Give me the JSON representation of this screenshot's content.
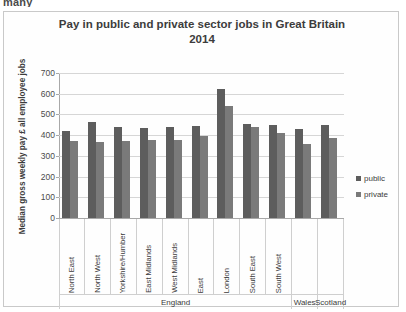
{
  "page": {
    "top_cut_text": "many"
  },
  "chart_data": {
    "type": "bar",
    "title": "Pay in public and private sector jobs in Great Britain",
    "title_line2": "2014",
    "xlabel": "",
    "ylabel": "Median gross weekly pay £ all employee jobs",
    "ylim": [
      0,
      700
    ],
    "yticks": [
      0,
      100,
      200,
      300,
      400,
      500,
      600,
      700
    ],
    "grid": true,
    "legend_position": "right",
    "categories": [
      "North East",
      "North West",
      "Yorkshire/Humber",
      "East Midlands",
      "West Midlands",
      "East",
      "London",
      "South East",
      "South West",
      "",
      ""
    ],
    "groups": [
      {
        "label": "England",
        "span": 9
      },
      {
        "label": "Wales",
        "span": 1
      },
      {
        "label": "Scotland",
        "span": 1
      }
    ],
    "series": [
      {
        "name": "public",
        "color": "#5d5d5d",
        "values": [
          420,
          465,
          440,
          435,
          440,
          445,
          625,
          455,
          450,
          430,
          450
        ]
      },
      {
        "name": "private",
        "color": "#7a7a7a",
        "values": [
          370,
          365,
          370,
          375,
          375,
          395,
          540,
          440,
          410,
          355,
          385
        ]
      }
    ]
  }
}
